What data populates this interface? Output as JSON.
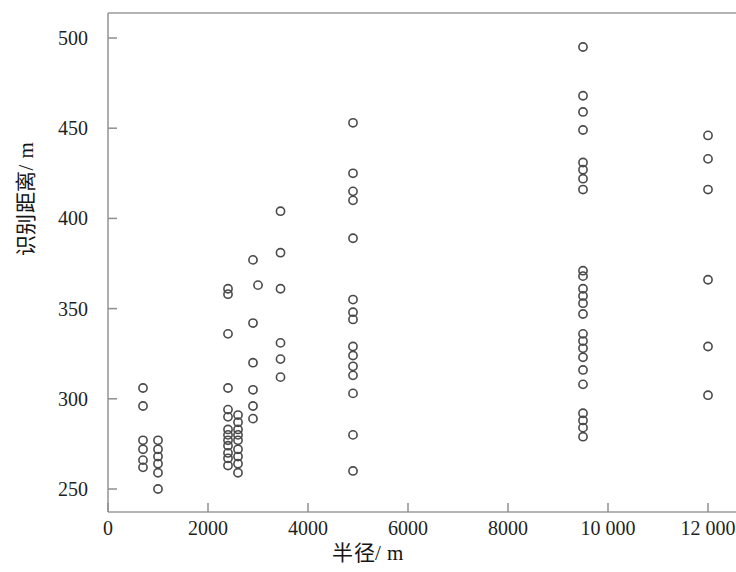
{
  "chart_data": {
    "type": "scatter",
    "title": "",
    "xlabel": "半径 / m",
    "ylabel": "识别距离 / m",
    "xlim": [
      -400,
      12600
    ],
    "ylim": [
      232,
      513
    ],
    "grid": false,
    "legend": null,
    "marker_style": "open-circle",
    "xticks": [
      0,
      2000,
      4000,
      6000,
      8000,
      10000,
      12000
    ],
    "xtick_labels": [
      "0",
      "2000",
      "4000",
      "6000",
      "8000",
      "10 000",
      "12 000"
    ],
    "yticks": [
      250,
      300,
      350,
      400,
      450,
      500
    ],
    "ytick_labels": [
      "250",
      "300",
      "350",
      "400",
      "450",
      "500"
    ],
    "series": [
      {
        "name": "识别距离",
        "points": [
          [
            700,
            306
          ],
          [
            700,
            296
          ],
          [
            700,
            277
          ],
          [
            700,
            272
          ],
          [
            700,
            266
          ],
          [
            700,
            262
          ],
          [
            1000,
            277
          ],
          [
            1000,
            272
          ],
          [
            1000,
            268
          ],
          [
            1000,
            264
          ],
          [
            1000,
            259
          ],
          [
            1000,
            250
          ],
          [
            2400,
            361
          ],
          [
            2400,
            358
          ],
          [
            2400,
            336
          ],
          [
            2400,
            306
          ],
          [
            2400,
            294
          ],
          [
            2400,
            290
          ],
          [
            2400,
            283
          ],
          [
            2400,
            280
          ],
          [
            2400,
            277
          ],
          [
            2400,
            274
          ],
          [
            2400,
            270
          ],
          [
            2400,
            267
          ],
          [
            2400,
            263
          ],
          [
            2600,
            291
          ],
          [
            2600,
            287
          ],
          [
            2600,
            283
          ],
          [
            2600,
            280
          ],
          [
            2600,
            277
          ],
          [
            2600,
            272
          ],
          [
            2600,
            268
          ],
          [
            2600,
            264
          ],
          [
            2600,
            259
          ],
          [
            2900,
            377
          ],
          [
            2900,
            342
          ],
          [
            2900,
            320
          ],
          [
            2900,
            305
          ],
          [
            2900,
            296
          ],
          [
            2900,
            289
          ],
          [
            3000,
            363
          ],
          [
            3450,
            404
          ],
          [
            3450,
            381
          ],
          [
            3450,
            361
          ],
          [
            3450,
            331
          ],
          [
            3450,
            322
          ],
          [
            3450,
            312
          ],
          [
            4900,
            453
          ],
          [
            4900,
            425
          ],
          [
            4900,
            415
          ],
          [
            4900,
            410
          ],
          [
            4900,
            389
          ],
          [
            4900,
            355
          ],
          [
            4900,
            348
          ],
          [
            4900,
            344
          ],
          [
            4900,
            329
          ],
          [
            4900,
            324
          ],
          [
            4900,
            318
          ],
          [
            4900,
            313
          ],
          [
            4900,
            303
          ],
          [
            4900,
            280
          ],
          [
            4900,
            260
          ],
          [
            9500,
            495
          ],
          [
            9500,
            468
          ],
          [
            9500,
            459
          ],
          [
            9500,
            449
          ],
          [
            9500,
            431
          ],
          [
            9500,
            427
          ],
          [
            9500,
            422
          ],
          [
            9500,
            416
          ],
          [
            9500,
            371
          ],
          [
            9500,
            368
          ],
          [
            9500,
            361
          ],
          [
            9500,
            357
          ],
          [
            9500,
            353
          ],
          [
            9500,
            347
          ],
          [
            9500,
            336
          ],
          [
            9500,
            332
          ],
          [
            9500,
            328
          ],
          [
            9500,
            323
          ],
          [
            9500,
            316
          ],
          [
            9500,
            308
          ],
          [
            9500,
            292
          ],
          [
            9500,
            288
          ],
          [
            9500,
            284
          ],
          [
            9500,
            279
          ],
          [
            12000,
            446
          ],
          [
            12000,
            433
          ],
          [
            12000,
            416
          ],
          [
            12000,
            366
          ],
          [
            12000,
            329
          ],
          [
            12000,
            302
          ]
        ]
      }
    ]
  },
  "axis": {
    "x_label_text": "半径",
    "x_label_unit": "/ m",
    "y_label_text": "识别距离",
    "y_label_unit": "/ m"
  },
  "colors": {
    "marker_stroke": "#4a4a4a",
    "axis": "#9a9a9a",
    "text": "#1c1c1c",
    "background": "#ffffff"
  }
}
